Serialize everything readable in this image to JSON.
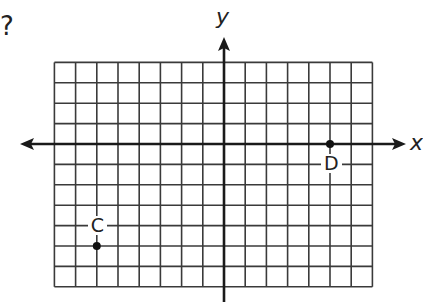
{
  "question_mark": "?",
  "axes": {
    "x_label": "x",
    "y_label": "y"
  },
  "grid": {
    "x_min": -8,
    "x_max": 7,
    "y_min": -7,
    "y_max": 4,
    "origin_px": [
      224,
      144
    ],
    "cell_w": 21.2,
    "cell_h": 20.4,
    "line_color": "#3a3a3a",
    "axis_color": "#1a1a1a"
  },
  "points": [
    {
      "name": "C",
      "x": -6,
      "y": -5,
      "label_pos": "above"
    },
    {
      "name": "D",
      "x": 5,
      "y": 0,
      "label_pos": "below"
    }
  ]
}
